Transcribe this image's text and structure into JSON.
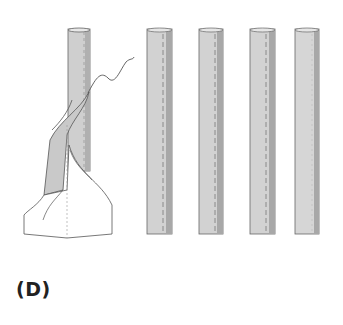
{
  "figure": {
    "label": "(D)",
    "colors": {
      "tube_fill": "#cfcfcf",
      "tube_shadow": "#a8a8a8",
      "outline": "#555555",
      "stitch": "#777777",
      "fabric": "#ffffff"
    },
    "tubes": [
      {
        "x": 147,
        "y": 29,
        "w": 25,
        "h": 205
      },
      {
        "x": 199,
        "y": 29,
        "w": 24,
        "h": 205
      },
      {
        "x": 250,
        "y": 29,
        "w": 25,
        "h": 205
      },
      {
        "x": 295,
        "y": 29,
        "w": 24,
        "h": 205
      }
    ]
  }
}
